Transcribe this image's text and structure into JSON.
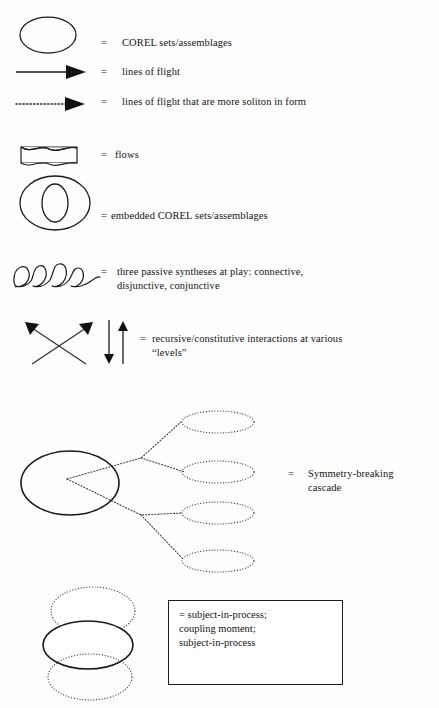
{
  "document": {
    "type": "legend-key",
    "background_color": "#fefefe",
    "ink_color": "#1a1a1a"
  },
  "legend": {
    "equals_sign": "=",
    "entries": [
      {
        "id": "corel-sets",
        "symbol": "open-ellipse",
        "equals": "=",
        "text": "COREL sets/assemblages"
      },
      {
        "id": "lines-of-flight",
        "symbol": "solid-arrow-right",
        "equals": "=",
        "text": "lines of flight"
      },
      {
        "id": "lines-of-flight-soliton",
        "symbol": "dotted-arrow-right",
        "equals": "=",
        "text": "lines of flight that are more soliton in form"
      },
      {
        "id": "flows",
        "symbol": "wavy-rectangle",
        "equals": "=",
        "text": "flows"
      },
      {
        "id": "embedded-corel-sets",
        "symbol": "nested-ellipse",
        "equals": "=",
        "text": "embedded COREL sets/assemblages"
      },
      {
        "id": "passive-syntheses",
        "symbol": "hand-drawn-loops",
        "equals": "=",
        "text": "three passive syntheses at play: connective,\ndisjunctive, conjunctive"
      },
      {
        "id": "recursive-interactions",
        "symbol": "crossed-arrows-and-updown-arrows",
        "equals": "=",
        "text": "recursive/constitutive interactions at various\n“levels”"
      },
      {
        "id": "symmetry-breaking-cascade",
        "symbol": "cascade-diagram",
        "equals": "=",
        "text": "Symmetry-breaking\ncascade"
      },
      {
        "id": "subject-in-process",
        "symbol": "three-stacked-ellipses",
        "equals": "=",
        "text": "= subject-in-process;\ncoupling moment;\nsubject-in-process"
      }
    ]
  },
  "cascade": {
    "source_label": "solid-ellipse-source",
    "branch_count": 4,
    "branch_style": "dotted",
    "node_style": "dotted-ellipse"
  },
  "stack": {
    "ellipses": [
      {
        "style": "dotted",
        "position": "top"
      },
      {
        "style": "solid",
        "position": "middle"
      },
      {
        "style": "dotted",
        "position": "bottom"
      }
    ]
  }
}
